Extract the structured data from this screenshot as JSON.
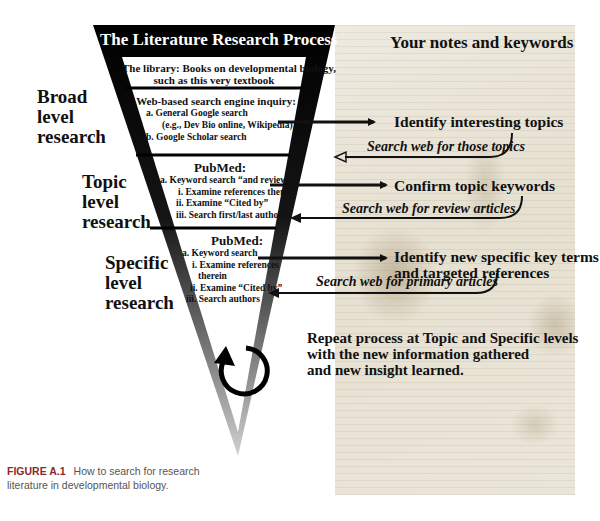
{
  "funnel": {
    "title": "The Literature Research Process",
    "sections": [
      {
        "heading": "The library: Books on developmental biology,",
        "heading2": "such as this very textbook"
      },
      {
        "heading": "Web-based search engine inquiry:",
        "items": [
          "a. General Google search",
          "(e.g., Dev Bio online, Wikipedia)",
          "b. Google Scholar search"
        ]
      },
      {
        "heading": "PubMed:",
        "items": [
          "a. Keyword search “and review”",
          "i. Examine references therein",
          "ii. Examine “Cited by”",
          "iii. Search first/last authors"
        ]
      },
      {
        "heading": "PubMed:",
        "items": [
          "a. Keyword search",
          "i. Examine references",
          "therein",
          "ii. Examine “Cited by”",
          "iii. Search authors"
        ]
      }
    ],
    "cycle_icon": "circular-arrow-icon"
  },
  "levels": [
    {
      "line1": "Broad",
      "line2": "level",
      "line3": "research"
    },
    {
      "line1": "Topic",
      "line2": "level",
      "line3": "research"
    },
    {
      "line1": "Specific",
      "line2": "level",
      "line3": "research"
    }
  ],
  "notes": {
    "title": "Your notes and keywords",
    "steps": [
      {
        "label": "Identify interesting topics",
        "return_label": "Search web for those topics"
      },
      {
        "label": "Confirm topic keywords",
        "return_label": "Search web for review articles"
      },
      {
        "label": "Identify new specific key terms",
        "label2": "and targeted references",
        "return_label": "Search web for primary articles"
      }
    ],
    "repeat": [
      "Repeat process at Topic and Specific levels",
      "with the new information gathered",
      "and new insight learned."
    ]
  },
  "caption": {
    "figure_label": "FIGURE A.1",
    "text1": "How to search for research",
    "text2": "literature in developmental biology."
  },
  "colors": {
    "funnel_dark": "#000000",
    "funnel_light": "#c8c8c8",
    "parchment": "#e9e4d6",
    "figure_label": "#8b2a2a"
  }
}
